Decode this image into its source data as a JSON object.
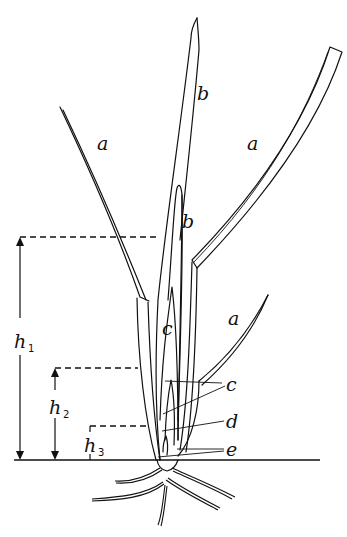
{
  "diagram": {
    "labels": {
      "leaf_left": "a",
      "leaf_right": "a",
      "leaf_lower": "a",
      "blade_top": "b",
      "blade_inner": "b",
      "sheath_c": "c",
      "callout_c": "c",
      "callout_d": "d",
      "callout_e": "e"
    },
    "measurements": [
      {
        "symbol": "h",
        "subscript": "1"
      },
      {
        "symbol": "h",
        "subscript": "2"
      },
      {
        "symbol": "h",
        "subscript": "3"
      }
    ],
    "colors": {
      "ink": "#111111",
      "background": "#ffffff"
    }
  }
}
